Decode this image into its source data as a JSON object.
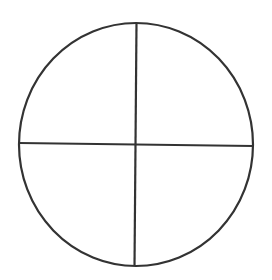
{
  "diagram": {
    "type": "circle-quadrants",
    "background": "#ffffff",
    "stroke_color": "#333333",
    "stroke_width": 2.2,
    "circle": {
      "cx": 136,
      "cy": 144.5,
      "rx": 117,
      "ry": 121.5
    },
    "vertical_line": {
      "x1": 136.5,
      "y1": 23,
      "x2": 134.5,
      "y2": 266
    },
    "horizontal_line": {
      "x1": 19,
      "y1": 143,
      "x2": 253,
      "y2": 146
    },
    "quadrants": 4
  }
}
